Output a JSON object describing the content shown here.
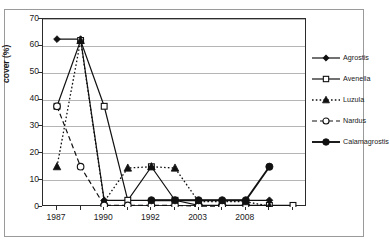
{
  "chart_data": {
    "type": "line",
    "title": "",
    "xlabel": "",
    "ylabel": "cover (%)",
    "ylim": [
      0,
      70
    ],
    "ytick_values": [
      0,
      10,
      20,
      30,
      40,
      50,
      60,
      70
    ],
    "ytick_labels": [
      "0",
      "10",
      "20",
      "30",
      "40",
      "50",
      "60",
      "70"
    ],
    "grid": "horizontal",
    "legend_position": "right",
    "x_positions": [
      0,
      1,
      2,
      3,
      4,
      5,
      6,
      7,
      8,
      9,
      10
    ],
    "xtick_labels": [
      "1987",
      "",
      "1990",
      "",
      "1992",
      "",
      "2003",
      "",
      "2008",
      "",
      ""
    ],
    "xtick_labeled_positions": [
      0,
      2,
      4,
      6,
      8
    ],
    "xtick_labeled_values": [
      "1987",
      "1990",
      "1992",
      "2003",
      "2008"
    ],
    "series": [
      {
        "name": "Agrostis",
        "marker": "filled-diamond",
        "line_style": "solid",
        "x": [
          0,
          1,
          2,
          3,
          4,
          5,
          6,
          7,
          8,
          9
        ],
        "values": [
          62.5,
          62.5,
          2.5,
          2.5,
          2.5,
          2.5,
          2.5,
          2.5,
          2.5,
          2.5
        ]
      },
      {
        "name": "Avenella",
        "marker": "open-square",
        "line_style": "solid",
        "x": [
          0,
          1,
          2,
          3,
          4,
          5,
          6,
          7,
          8,
          9,
          10
        ],
        "values": [
          37.5,
          62.0,
          37.5,
          2.5,
          15.0,
          2.5,
          0.6,
          0.6,
          0.6,
          0.6,
          0.6
        ]
      },
      {
        "name": "Luzula",
        "marker": "filled-triangle",
        "line_style": "dotted",
        "x": [
          0,
          1,
          2,
          3,
          4,
          5,
          6,
          7,
          8,
          9
        ],
        "values": [
          15.0,
          62.0,
          2.0,
          14.5,
          15.0,
          14.5,
          2.0,
          2.0,
          2.0,
          0.3
        ]
      },
      {
        "name": "Nardus",
        "marker": "open-circle",
        "line_style": "dashed",
        "x": [
          0,
          1,
          2,
          3,
          4,
          5,
          6,
          7
        ],
        "values": [
          37.5,
          15.0,
          0.6,
          0.6,
          0.6,
          0.6,
          0.3,
          0.3
        ]
      },
      {
        "name": "Calamagrostis",
        "marker": "filled-circle",
        "line_style": "solid-thick",
        "x": [
          4,
          5,
          6,
          7,
          8,
          9
        ],
        "values": [
          2.5,
          2.5,
          2.5,
          2.5,
          2.5,
          15.0
        ]
      }
    ]
  },
  "axes": {
    "y_title": "cover (%)"
  },
  "legend": {
    "entries": [
      {
        "label": "Agrostis",
        "marker": "filled-diamond",
        "line_style": "solid"
      },
      {
        "label": "Avenella",
        "marker": "open-square",
        "line_style": "solid"
      },
      {
        "label": "Luzula",
        "marker": "filled-triangle",
        "line_style": "dotted"
      },
      {
        "label": "Nardus",
        "marker": "open-circle",
        "line_style": "dashed"
      },
      {
        "label": "Calamagrostis",
        "marker": "filled-circle",
        "line_style": "solid-thick"
      }
    ]
  },
  "colors": {
    "series_stroke": "#1a1a1a",
    "gridline": "#b5b5b5",
    "axis": "#2b2b2b",
    "background": "#ffffff",
    "frame": "#9a9a9a"
  }
}
